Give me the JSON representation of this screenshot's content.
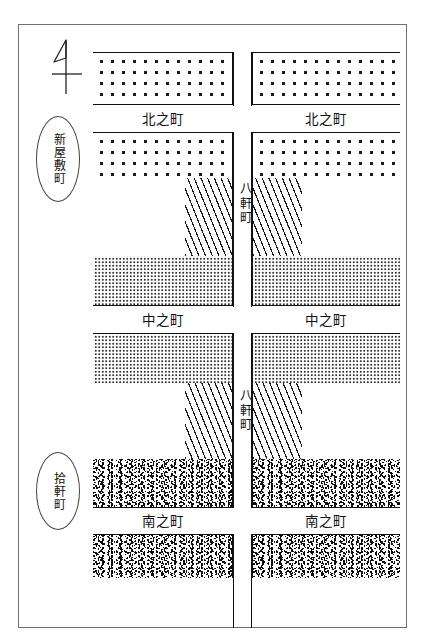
{
  "map": {
    "title": "町割図",
    "orientation_icon": "north-arrow-icon",
    "districts": [
      {
        "id": "shinyashiki",
        "label": "新屋敷町"
      },
      {
        "id": "jikken",
        "label": "拾軒町"
      }
    ],
    "streets_horizontal": [
      {
        "id": "kita-no-cho-left",
        "label": "北之町"
      },
      {
        "id": "kita-no-cho-right",
        "label": "北之町"
      },
      {
        "id": "naka-no-cho-left",
        "label": "中之町"
      },
      {
        "id": "naka-no-cho-right",
        "label": "中之町"
      },
      {
        "id": "minami-no-cho-left",
        "label": "南之町"
      },
      {
        "id": "minami-no-cho-right",
        "label": "南之町"
      }
    ],
    "streets_vertical": [
      {
        "id": "hachiken-cho-upper",
        "label": "八軒町"
      },
      {
        "id": "hachiken-cho-lower",
        "label": "八軒町"
      }
    ],
    "block_textures": [
      {
        "id": "dots",
        "name": "coarse-dot-block"
      },
      {
        "id": "stipple",
        "name": "fine-stipple-block"
      },
      {
        "id": "hatch",
        "name": "diagonal-hatch-block"
      },
      {
        "id": "speckle",
        "name": "dense-speckle-block"
      }
    ],
    "colors": {
      "ink": "#111111",
      "frame": "#6e6e6e",
      "paper": "#ffffff"
    }
  }
}
